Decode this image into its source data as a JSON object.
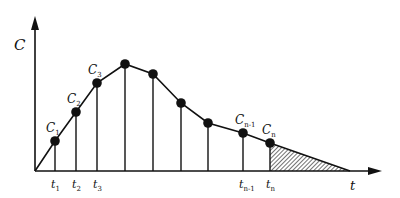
{
  "diagram": {
    "title": "",
    "axes": {
      "y_label": "C",
      "x_label": "t",
      "origin": [
        35,
        171
      ],
      "y_arrow_tip": [
        35,
        16
      ],
      "x_arrow_tip": [
        382,
        171
      ]
    },
    "points": [
      {
        "x": 55,
        "y": 141,
        "label": "C",
        "sub": "1",
        "tlabel": "t",
        "tsub": "1"
      },
      {
        "x": 76,
        "y": 112,
        "label": "C",
        "sub": "2",
        "tlabel": "t",
        "tsub": "2"
      },
      {
        "x": 97,
        "y": 83,
        "label": "C",
        "sub": "3",
        "tlabel": "t",
        "tsub": "3"
      },
      {
        "x": 125,
        "y": 64,
        "label": "",
        "sub": "",
        "tlabel": "",
        "tsub": ""
      },
      {
        "x": 153,
        "y": 74,
        "label": "",
        "sub": "",
        "tlabel": "",
        "tsub": ""
      },
      {
        "x": 181,
        "y": 103,
        "label": "",
        "sub": "",
        "tlabel": "",
        "tsub": ""
      },
      {
        "x": 208,
        "y": 123,
        "label": "",
        "sub": "",
        "tlabel": "",
        "tsub": ""
      },
      {
        "x": 243,
        "y": 133,
        "label": "C",
        "sub": "n-1",
        "tlabel": "t",
        "tsub": "n-1"
      },
      {
        "x": 270,
        "y": 143,
        "label": "C",
        "sub": "n",
        "tlabel": "t",
        "tsub": "n"
      }
    ],
    "tail_end": [
      350,
      171
    ],
    "shaded_region": "extrapolated area after t_n (hatched triangle)",
    "colors": {
      "line": "#111111",
      "background": "#ffffff"
    }
  }
}
